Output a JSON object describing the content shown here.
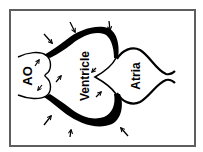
{
  "diagram": {
    "labels": {
      "aorta": "AO",
      "ventricle": "Ventricle",
      "atria": "Atria"
    },
    "orientation": "text rotated 90° counter-clockwise",
    "colors": {
      "stroke": "#000000",
      "frame": "#5e5e5e",
      "background": "#ffffff"
    },
    "arrows": {
      "outer_count": 7,
      "inner_count": 5
    }
  }
}
